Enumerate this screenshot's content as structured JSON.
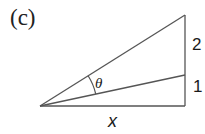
{
  "figure": {
    "panel_label": "(c)",
    "angle_label": "θ",
    "segment_labels": {
      "upper": "2",
      "lower": "1"
    },
    "base_label": "x",
    "colors": {
      "line": "#555555",
      "text": "#1a1a1a",
      "background": "#ffffff"
    },
    "geometry": {
      "apex": [
        40,
        106
      ],
      "base_right": [
        185,
        106
      ],
      "mid_vertical": [
        185,
        75
      ],
      "top_vertical": [
        185,
        15
      ]
    }
  }
}
